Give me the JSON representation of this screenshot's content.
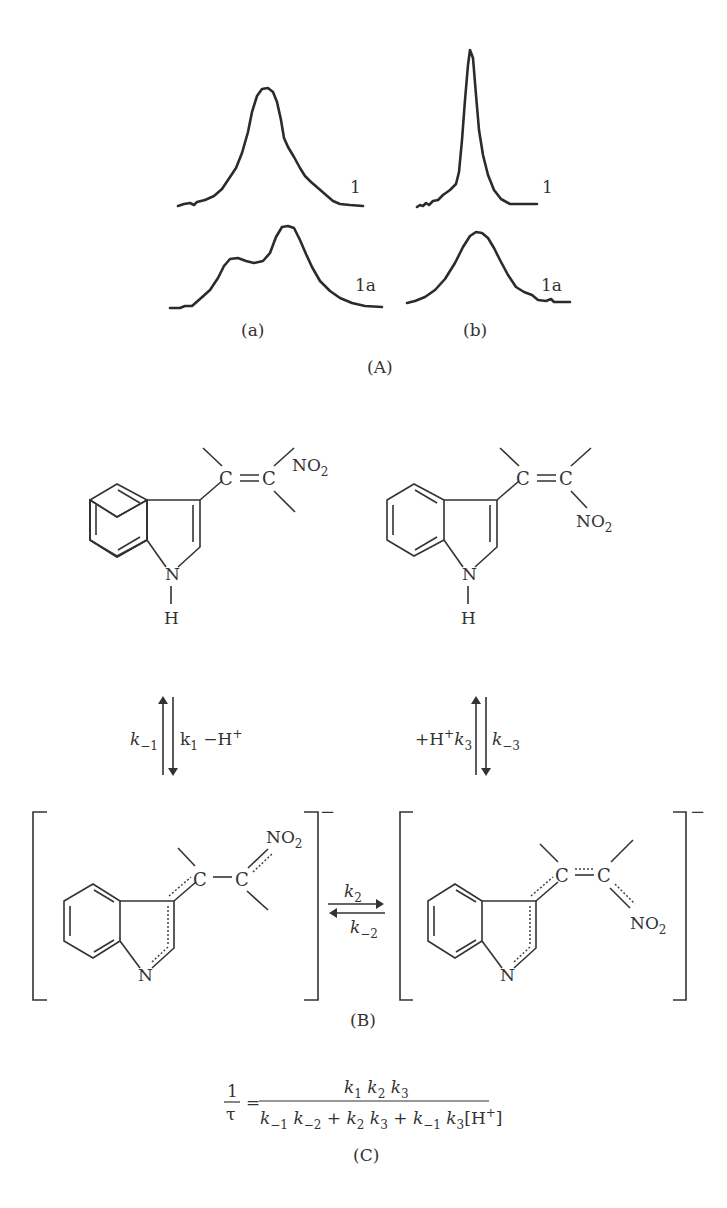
{
  "panel_A": {
    "label": "(A)",
    "spectra": [
      {
        "group": "(a)",
        "trace_label_top": "1",
        "trace_label_bottom": "1a"
      },
      {
        "group": "(b)",
        "trace_label_top": "1",
        "trace_label_bottom": "1a"
      }
    ]
  },
  "panel_B": {
    "label": "(B)",
    "top_left": {
      "substituent": "NO",
      "substituent_sub": "2",
      "c_left": "C",
      "c_right": "C",
      "n": "N",
      "h": "H"
    },
    "top_right": {
      "substituent": "NO",
      "substituent_sub": "2",
      "c_left": "C",
      "c_right": "C",
      "n": "N",
      "h": "H"
    },
    "bottom_left": {
      "substituent": "NO",
      "substituent_sub": "2",
      "c_left": "C",
      "c_right": "C",
      "n": "N",
      "charge": "−"
    },
    "bottom_right": {
      "substituent": "NO",
      "substituent_sub": "2",
      "c_left": "C",
      "c_right": "C",
      "n": "N",
      "charge": "−"
    },
    "left_equilibrium": {
      "up_label": "k",
      "up_sub": "−1",
      "down_label": "k",
      "down_sub": "1",
      "down_extra": " −H",
      "down_sup": "+"
    },
    "right_equilibrium": {
      "up_prefix": "+H",
      "up_sup": "+",
      "up_label": "k",
      "up_sub": "3",
      "down_label": "k",
      "down_sub": "−3"
    },
    "middle_equilibrium": {
      "forward_label": "k",
      "forward_sub": "2",
      "reverse_label": "k",
      "reverse_sub": "−2"
    }
  },
  "panel_C": {
    "label": "(C)",
    "lhs_num": "1",
    "lhs_den": "τ",
    "equals": "=",
    "numerator": [
      {
        "k": "k",
        "s": "1"
      },
      {
        "k": "k",
        "s": "2"
      },
      {
        "k": "k",
        "s": "3"
      }
    ],
    "denominator_text": "k₋₁ k₋₂ + k₂ k₃ + k₋₁ k₃[H⁺]",
    "denominator": {
      "t1a": "k",
      "t1a_s": "−1",
      "t1b": "k",
      "t1b_s": "−2",
      "plus1": "+",
      "t2a": "k",
      "t2a_s": "2",
      "t2b": "k",
      "t2b_s": "3",
      "plus2": "+",
      "t3a": "k",
      "t3a_s": "−1",
      "t3b": "k",
      "t3b_s": "3",
      "h_open": "[H",
      "h_sup": "+",
      "h_close": "]"
    }
  }
}
